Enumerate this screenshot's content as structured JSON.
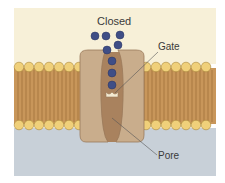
{
  "diagram": {
    "title": "Closed",
    "labels": {
      "gate": "Gate",
      "pore": "Pore"
    },
    "colors": {
      "extracellular": "#f7f0d8",
      "intracellular": "#c8d0d8",
      "membrane_tails": "#c8965a",
      "head_groups": "#f0d07a",
      "channel_protein": "#c9ad8c",
      "pore": "#a9825e",
      "ions": "#3f4e86"
    },
    "ion_count": 7
  }
}
